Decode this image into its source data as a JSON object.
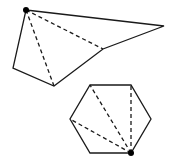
{
  "diagram": {
    "stroke_color": "#1a1a1a",
    "background": "#ffffff",
    "shapes": [
      {
        "name": "pentagon",
        "vertices": [
          [
            26,
            10
          ],
          [
            164,
            26
          ],
          [
            103,
            49
          ],
          [
            54,
            86
          ],
          [
            13,
            68
          ]
        ],
        "marked_vertex": [
          26,
          10
        ],
        "diagonals": [
          [
            [
              26,
              10
            ],
            [
              103,
              49
            ]
          ],
          [
            [
              26,
              10
            ],
            [
              54,
              86
            ]
          ]
        ]
      },
      {
        "name": "hexagon",
        "vertices": [
          [
            90,
            85
          ],
          [
            131,
            85
          ],
          [
            151,
            119
          ],
          [
            131,
            153
          ],
          [
            90,
            153
          ],
          [
            70,
            119
          ]
        ],
        "marked_vertex": [
          131,
          153
        ],
        "diagonals": [
          [
            [
              131,
              153
            ],
            [
              90,
              85
            ]
          ],
          [
            [
              131,
              153
            ],
            [
              131,
              85
            ]
          ],
          [
            [
              131,
              153
            ],
            [
              70,
              119
            ]
          ]
        ]
      }
    ]
  }
}
